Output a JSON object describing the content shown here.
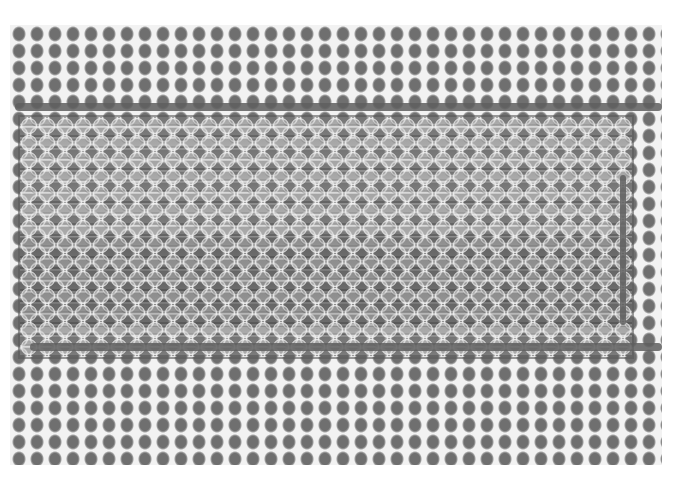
{
  "image": {
    "description": "Grayscale micrograph of a hexagonal honeycomb mesh with a rectangular woven strip of horizontal fibers",
    "background": "#ffffff",
    "mesh_color": "#f2f2f2",
    "cell_color": "#6f6f6f",
    "strip_color": "#808080"
  }
}
